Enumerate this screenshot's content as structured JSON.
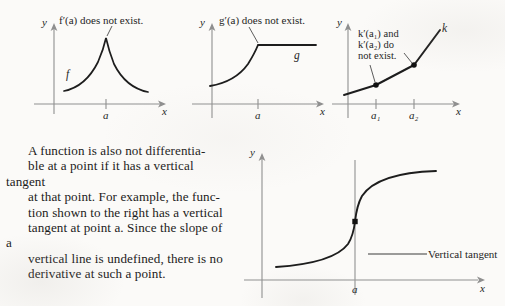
{
  "page": {
    "background_color": "#fbfaf8",
    "ink_color": "#1a1a1a",
    "axis_color": "#8d8d8d",
    "curve_color": "#1d1d1d",
    "width": 505,
    "height": 306
  },
  "prose": {
    "text": "A function is also not differentiable at a point if it has a vertical tangent at that point. For example, the function shown to the right has a vertical tangent at point a. Since the slope of a vertical line is undefined, there is no derivative at such a point.",
    "lines": [
      "A function is also not differentia-",
      "ble at a point if it has a vertical tangent",
      "at that point. For example, the func-",
      "tion shown to the right has a vertical",
      "tangent at point a. Since the slope of a",
      "vertical line is undefined, there is no",
      "derivative at such a point."
    ],
    "italic_terms": [
      "a"
    ]
  },
  "figures": [
    {
      "id": "fig-corner-cusp",
      "caption": "f′(a) does not exist.",
      "y_axis_label": "y",
      "x_axis_label": "x",
      "curve_label": "f",
      "x_ticks": [
        {
          "label": "a",
          "value": "a"
        }
      ],
      "description": "cusp at x = a"
    },
    {
      "id": "fig-corner-g",
      "caption": "g′(a) does not exist.",
      "y_axis_label": "y",
      "x_axis_label": "x",
      "curve_label": "g",
      "x_ticks": [
        {
          "label": "a",
          "value": "a"
        }
      ],
      "description": "corner at x = a with horizontal segment to the right"
    },
    {
      "id": "fig-corner-k",
      "caption_lines": [
        "k′(a₁) and",
        "k′(a₂) do",
        "not exist."
      ],
      "caption": "k′(a₁) and k′(a₂) do not exist.",
      "y_axis_label": "y",
      "x_axis_label": "x",
      "curve_label": "k",
      "x_ticks": [
        {
          "label": "a₁",
          "value": "a1"
        },
        {
          "label": "a₂",
          "value": "a2"
        }
      ],
      "description": "piecewise linear with corners at a1 and a2"
    },
    {
      "id": "fig-vertical-tangent",
      "y_axis_label": "y",
      "x_axis_label": "x",
      "annotation": "Vertical tangent",
      "x_ticks": [
        {
          "label": "a",
          "value": "a"
        }
      ],
      "description": "cube-root style curve with vertical tangent at x = a"
    }
  ]
}
